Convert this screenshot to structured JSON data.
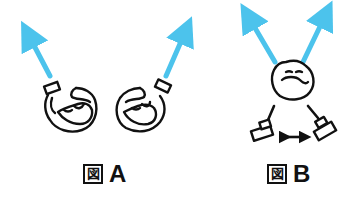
{
  "figures": [
    {
      "id": "A",
      "caption_prefix": "図",
      "caption_letter": "A",
      "description": "two figures seen from above, each with an arrow pointing outward"
    },
    {
      "id": "B",
      "caption_prefix": "図",
      "caption_letter": "B",
      "description": "one figure with two arrows, two objects below connected by a double-headed arrow"
    }
  ],
  "colors": {
    "arrow": "#4cc3ec",
    "stroke": "#111111",
    "background": "#ffffff"
  },
  "icons": {
    "direction_arrow": "arrow-up-icon",
    "double_arrow": "double-headed-arrow-icon"
  }
}
